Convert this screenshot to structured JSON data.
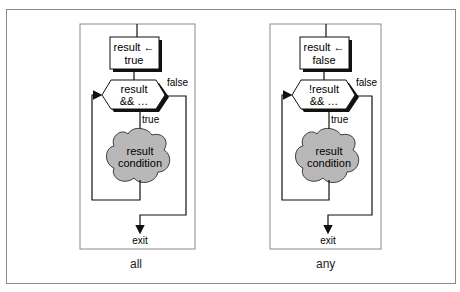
{
  "diagrams": [
    {
      "caption": "all",
      "init_line1": "result ←",
      "init_line2": "true",
      "test_line1": "result",
      "test_line2": "&& …",
      "false_label": "false",
      "true_label": "true",
      "body_line1": "result",
      "body_line2": "condition",
      "exit_label": "exit"
    },
    {
      "caption": "any",
      "init_line1": "result ←",
      "init_line2": "false",
      "test_line1": "!result",
      "test_line2": "&& …",
      "false_label": "false",
      "true_label": "true",
      "body_line1": "result",
      "body_line2": "condition",
      "exit_label": "exit"
    }
  ],
  "colors": {
    "stroke": "#111111",
    "panel_border": "#8a8a8a",
    "cloud_fill": "#b8b8b8"
  }
}
